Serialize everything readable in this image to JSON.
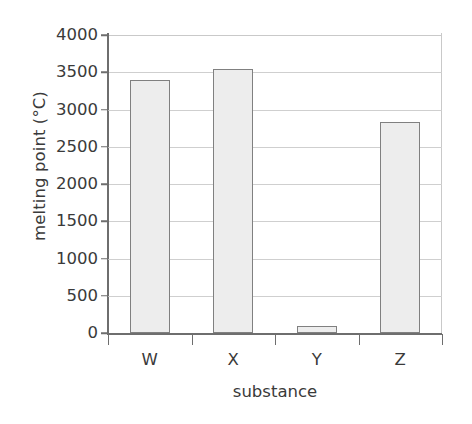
{
  "chart_data": {
    "type": "bar",
    "title": "",
    "subtitle": "",
    "categories": [
      "W",
      "X",
      "Y",
      "Z"
    ],
    "values": [
      3400,
      3550,
      100,
      2830
    ],
    "xlabel": "substance",
    "ylabel": "melting point (°C)",
    "ylim": [
      0,
      4000
    ],
    "yticks": [
      0,
      500,
      1000,
      1500,
      2000,
      2500,
      3000,
      3500,
      4000
    ],
    "ytick_labels": [
      "0",
      "500",
      "1000",
      "1500",
      "2000",
      "2500",
      "3000",
      "3500",
      "4000"
    ],
    "grid": true,
    "grid_axis": "y",
    "legend": false,
    "legend_position": "none",
    "annotations": [],
    "series": [
      {
        "name": "melting point",
        "values": [
          3400,
          3550,
          100,
          2830
        ]
      }
    ]
  },
  "axes": {
    "y_title": "melting point (°C)",
    "x_title": "substance",
    "y_tick_labels": [
      "4000",
      "3500",
      "3000",
      "2500",
      "2000",
      "1500",
      "1000",
      "500",
      "0"
    ],
    "x_tick_labels": [
      "W",
      "X",
      "Y",
      "Z"
    ]
  },
  "style": {
    "background": "#ffffff",
    "bar_fill": "#ededed",
    "bar_border": "#808080",
    "gridline": "#cfcfcf",
    "axis_line": "#6e6e6e",
    "text": "#3a3a3a"
  }
}
